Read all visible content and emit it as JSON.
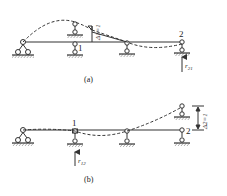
{
  "figure": {
    "panel_a": {
      "caption": "(a)",
      "node1_label": "1",
      "node2_label": "2",
      "displacement_label": "Δ1=1",
      "reaction_label": "r21",
      "reaction_main": "r",
      "reaction_sub": "21"
    },
    "panel_b": {
      "caption": "(b)",
      "node1_label": "1",
      "node2_label": "2",
      "displacement_label": "Δ2=1",
      "reaction_label": "r12",
      "reaction_main": "r",
      "reaction_sub": "12"
    },
    "colors": {
      "line": "#333333",
      "background": "#ffffff"
    }
  }
}
